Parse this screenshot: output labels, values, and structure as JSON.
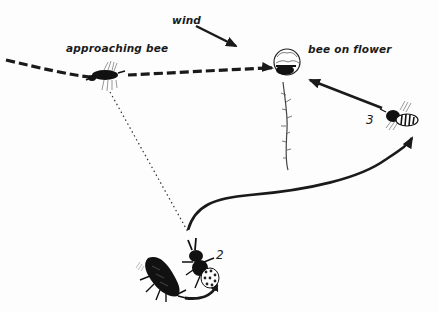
{
  "diagram": {
    "labels": {
      "wind": "wind",
      "approaching_bee": "approaching bee",
      "bee_on_flower": "bee on flower",
      "step_2": "2",
      "step_3": "3"
    },
    "colors": {
      "ink": "#1a1a1a",
      "background": "#fdfdfd"
    },
    "elements": [
      {
        "name": "flight-path",
        "style": "dashed",
        "from": "left edge",
        "to": "bee on flower"
      },
      {
        "name": "wind-arrow",
        "style": "solid",
        "direction": "down-right"
      },
      {
        "name": "sight-line",
        "style": "dotted",
        "from": "approaching bee",
        "to": "bee 2"
      },
      {
        "name": "attack-curve",
        "style": "solid",
        "from": "bee 2",
        "to": "bee 3"
      },
      {
        "name": "return-arrow",
        "style": "solid",
        "from": "bee 3",
        "to": "bee on flower"
      },
      {
        "name": "turn-arrow",
        "style": "solid",
        "from": "beetle",
        "to": "bee 2"
      }
    ]
  }
}
